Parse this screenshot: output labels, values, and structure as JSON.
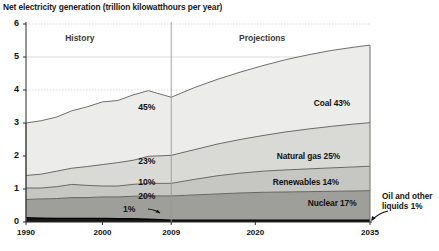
{
  "chart_title_prefix": "Net electricity generation (trillion ",
  "chart_title_strong": "kilowatthours",
  "chart_title_suffix": " per year)",
  "period_labels": {
    "history": "History",
    "projections": "Projections"
  },
  "series_labels": {
    "coal": "Coal  43%",
    "natural_gas": "Natural gas  25%",
    "renewables": "Renewables 14%",
    "nuclear": "Nuclear 17%",
    "oil": "Oil and other\nliquids 1%",
    "oil_line1": "Oil and other",
    "oil_line2": "liquids 1%"
  },
  "pct_2009": {
    "coal": "45%",
    "natural_gas": "23%",
    "renewables": "10%",
    "nuclear": "20%",
    "oil": "1%"
  },
  "colors": {
    "coal": "#ececea",
    "natural_gas": "#d9d9d6",
    "renewables": "#c6c6c2",
    "nuclear": "#9e9e9a",
    "oil": "#17171a",
    "line": "#4a4a4a",
    "grid": "#d0d0cd",
    "axis": "#2a2a2a",
    "divider": "#9a9a97"
  },
  "chart_data": {
    "type": "area",
    "stacked": true,
    "title": "Net electricity generation (trillion kilowatthours per year)",
    "xlabel": "",
    "ylabel": "",
    "xlim": [
      1990,
      2035
    ],
    "ylim": [
      0,
      6
    ],
    "yticks": [
      0,
      1,
      2,
      3,
      4,
      5,
      6
    ],
    "xticks": [
      1990,
      2000,
      2009,
      2020,
      2035
    ],
    "grid": true,
    "legend_position": "inline-right",
    "history_projection_divider": 2009,
    "annotations": [
      {
        "text": "History",
        "x": 1998,
        "y": 5.6
      },
      {
        "text": "Projections",
        "x": 2021,
        "y": 5.6
      },
      {
        "text": "45%",
        "x": 2006,
        "y": 3.5
      },
      {
        "text": "23%",
        "x": 2006,
        "y": 1.85
      },
      {
        "text": "10%",
        "x": 2006,
        "y": 1.2
      },
      {
        "text": "20%",
        "x": 2006,
        "y": 0.78
      },
      {
        "text": "1%",
        "x": 2004,
        "y": 0.35
      },
      {
        "text": "Coal  43%",
        "x": 2029,
        "y": 3.7
      },
      {
        "text": "Natural gas  25%",
        "x": 2026,
        "y": 2.0
      },
      {
        "text": "Renewables 14%",
        "x": 2026,
        "y": 1.25
      },
      {
        "text": "Nuclear 17%",
        "x": 2029,
        "y": 0.6
      },
      {
        "text": "Oil and other liquids 1%",
        "x": 2036,
        "y": 0.55
      }
    ],
    "x": [
      1990,
      1992,
      1994,
      1996,
      1998,
      2000,
      2002,
      2004,
      2006,
      2009,
      2012,
      2015,
      2018,
      2021,
      2024,
      2027,
      2030,
      2033,
      2035
    ],
    "series": [
      {
        "name": "Oil and other liquids",
        "key": "oil",
        "pct_2009": 1,
        "pct_2035": 1,
        "values": [
          0.13,
          0.12,
          0.11,
          0.11,
          0.11,
          0.11,
          0.1,
          0.1,
          0.09,
          0.06,
          0.06,
          0.06,
          0.06,
          0.06,
          0.06,
          0.06,
          0.06,
          0.06,
          0.06
        ]
      },
      {
        "name": "Nuclear",
        "key": "nuclear",
        "pct_2009": 20,
        "pct_2035": 17,
        "values": [
          0.55,
          0.58,
          0.6,
          0.63,
          0.63,
          0.65,
          0.66,
          0.68,
          0.7,
          0.73,
          0.76,
          0.79,
          0.82,
          0.84,
          0.85,
          0.86,
          0.87,
          0.88,
          0.89
        ]
      },
      {
        "name": "Renewables",
        "key": "renewables",
        "pct_2009": 10,
        "pct_2035": 14,
        "values": [
          0.35,
          0.33,
          0.36,
          0.4,
          0.37,
          0.33,
          0.33,
          0.36,
          0.38,
          0.38,
          0.47,
          0.55,
          0.6,
          0.64,
          0.67,
          0.69,
          0.71,
          0.73,
          0.74
        ]
      },
      {
        "name": "Natural gas",
        "key": "natural_gas",
        "pct_2009": 23,
        "pct_2035": 25,
        "values": [
          0.38,
          0.42,
          0.47,
          0.49,
          0.57,
          0.65,
          0.71,
          0.73,
          0.82,
          0.85,
          0.9,
          0.96,
          1.02,
          1.08,
          1.15,
          1.21,
          1.26,
          1.3,
          1.32
        ]
      },
      {
        "name": "Coal",
        "key": "coal",
        "pct_2009": 45,
        "pct_2035": 43,
        "values": [
          1.59,
          1.62,
          1.64,
          1.74,
          1.81,
          1.9,
          1.88,
          1.98,
          1.99,
          1.76,
          1.88,
          1.96,
          2.04,
          2.12,
          2.19,
          2.25,
          2.3,
          2.33,
          2.35
        ]
      }
    ],
    "totals": [
      3.0,
      3.07,
      3.18,
      3.37,
      3.49,
      3.64,
      3.68,
      3.85,
      3.98,
      3.78,
      4.07,
      4.32,
      4.54,
      4.74,
      4.92,
      5.07,
      5.2,
      5.3,
      5.36
    ]
  }
}
